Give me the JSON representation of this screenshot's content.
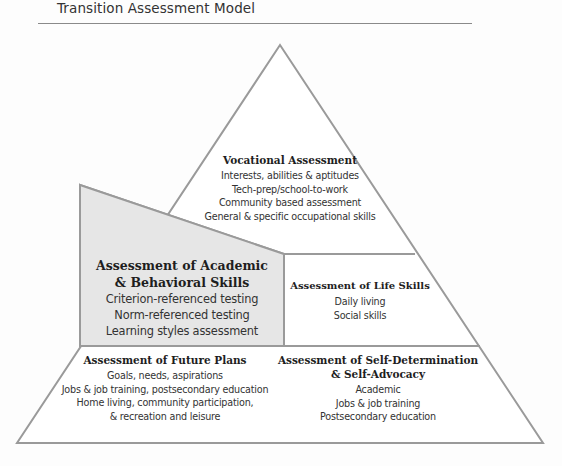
{
  "title": "Transition Assessment Model",
  "colors": {
    "outline": "#9a9a9a",
    "shaded_fill": "#e6e6e6",
    "text": "#2a2a2a"
  },
  "tiers": {
    "vocational": {
      "heading": "Vocational Assessment",
      "items": [
        "Interests, abilities & aptitudes",
        "Tech-prep/school-to-work",
        "Community based assessment",
        "General & specific occupational skills"
      ],
      "visible_last_item": "eral & specific occupational skills"
    },
    "academic": {
      "heading_line1": "Assessment of Academic",
      "heading_line2": "& Behavioral Skills",
      "items": [
        "Criterion-referenced testing",
        "Norm-referenced testing",
        "Learning styles assessment"
      ]
    },
    "life_skills": {
      "heading": "Assessment of Life Skills",
      "items": [
        "Daily living",
        "Social skills"
      ]
    },
    "future_plans": {
      "heading": "Assessment of Future Plans",
      "items": [
        "Goals, needs, aspirations",
        "Jobs & job training, postsecondary education",
        "Home living, community participation,",
        "& recreation and leisure"
      ]
    },
    "self_determination": {
      "heading_line1": "Assessment of Self-Determination",
      "heading_line2": "& Self-Advocacy",
      "items": [
        "Academic",
        "Jobs & job training",
        "Postsecondary education"
      ]
    }
  }
}
